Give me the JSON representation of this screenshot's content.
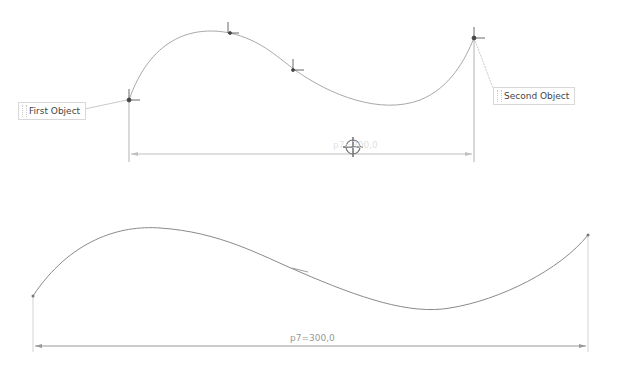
{
  "labels": {
    "first_object": "First Object",
    "second_object": "Second Object"
  },
  "top_dimension": {
    "label": "p7=300,0"
  },
  "bottom_dimension": {
    "label": "p7=300,0"
  },
  "colors": {
    "curve": "#9a9a9a",
    "dimension": "#b8b8b8",
    "handle": "#444444"
  }
}
